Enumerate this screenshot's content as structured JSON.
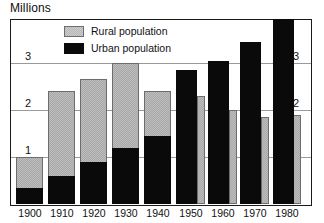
{
  "chart": {
    "title": "Millions",
    "y_axis_left_ticks": [
      "1",
      "2",
      "3"
    ],
    "y_axis_right_ticks": [
      "1",
      "2",
      "3"
    ],
    "legend": [
      {
        "key": "rural",
        "label": "Rural population",
        "color": "#b5b5b5"
      },
      {
        "key": "urban",
        "label": "Urban population",
        "color": "#0a0a0a"
      }
    ],
    "x_ticks": [
      "1900",
      "1910",
      "1920",
      "1930",
      "1940",
      "1950",
      "1960",
      "1970",
      "1980"
    ]
  },
  "chart_data": {
    "type": "bar",
    "title": "Millions",
    "xlabel": "",
    "ylabel": "Millions",
    "ylim": [
      0,
      4
    ],
    "yticks": [
      1,
      2,
      3
    ],
    "grid": true,
    "legend_position": "top-left-inside",
    "note": "1900-1940 drawn as stacked bars (urban bottom, rural on top = total). 1950-1980 drawn as grouped side-by-side bars (urban wide left, rural narrow right).",
    "categories": [
      "1900",
      "1910",
      "1920",
      "1930",
      "1940",
      "1950",
      "1960",
      "1970",
      "1980"
    ],
    "series": [
      {
        "name": "Urban population",
        "color": "#0a0a0a",
        "values": [
          0.35,
          0.6,
          0.9,
          1.2,
          1.45,
          2.85,
          3.05,
          3.45,
          3.95
        ]
      },
      {
        "name": "Rural population",
        "color": "#b5b5b5",
        "values": [
          0.65,
          1.8,
          1.75,
          1.8,
          0.95,
          2.3,
          2.0,
          1.85,
          1.9
        ]
      }
    ],
    "totals_1900_1940": [
      1.0,
      2.4,
      2.65,
      3.0,
      2.4
    ]
  },
  "render": {
    "groups": [
      {
        "year": "1900",
        "mode": "stacked",
        "x": 5,
        "w": 27,
        "urban": 0.35,
        "rural_top": 1.0
      },
      {
        "year": "1910",
        "mode": "stacked",
        "x": 37,
        "w": 27,
        "urban": 0.6,
        "rural_top": 2.4
      },
      {
        "year": "1920",
        "mode": "stacked",
        "x": 69,
        "w": 27,
        "urban": 0.9,
        "rural_top": 2.65
      },
      {
        "year": "1930",
        "mode": "stacked",
        "x": 101,
        "w": 27,
        "urban": 1.2,
        "rural_top": 3.0
      },
      {
        "year": "1940",
        "mode": "stacked",
        "x": 133,
        "w": 27,
        "urban": 1.45,
        "rural_top": 2.4
      },
      {
        "year": "1950",
        "mode": "grouped",
        "x": 165,
        "w": 21,
        "urban": 2.85,
        "rural": 2.3,
        "rx": 186,
        "rw": 8
      },
      {
        "year": "1960",
        "mode": "grouped",
        "x": 197,
        "w": 21,
        "urban": 3.05,
        "rural": 2.0,
        "rx": 218,
        "rw": 8
      },
      {
        "year": "1970",
        "mode": "grouped",
        "x": 229,
        "w": 21,
        "urban": 3.45,
        "rural": 1.85,
        "rx": 250,
        "rw": 8
      },
      {
        "year": "1980",
        "mode": "grouped",
        "x": 261,
        "w": 21,
        "urban": 3.95,
        "rural": 1.9,
        "rx": 282,
        "rw": 8
      }
    ],
    "scale": {
      "value_of_top": 4.0,
      "baseline_y": 184,
      "px_per_unit": 47.0,
      "frame_h": 184
    }
  }
}
